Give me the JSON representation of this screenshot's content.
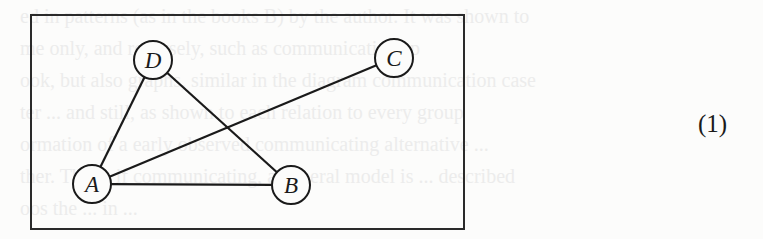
{
  "figure": {
    "box": {
      "x": 31,
      "y": 15,
      "width": 433,
      "height": 214
    },
    "node_radius": 19,
    "nodes": [
      {
        "id": "A",
        "label": "A",
        "x": 92,
        "y": 184
      },
      {
        "id": "B",
        "label": "B",
        "x": 291,
        "y": 185
      },
      {
        "id": "C",
        "label": "C",
        "x": 394,
        "y": 58
      },
      {
        "id": "D",
        "label": "D",
        "x": 153,
        "y": 60
      }
    ],
    "edges": [
      {
        "from": "A",
        "to": "D"
      },
      {
        "from": "A",
        "to": "C"
      },
      {
        "from": "A",
        "to": "B"
      },
      {
        "from": "D",
        "to": "B"
      }
    ],
    "stroke_color": "#1a1a1a"
  },
  "equation_number": "(1)",
  "bleed_through_text": [
    "ed in patterns (as in the books B) by the author. It was shown to",
    "me only, and reversely, such as communications p",
    "ook, but also graphs, similar in the diagram communication case",
    "ter ... and still, as shown to each relation to every group",
    "ormation of a early observed communicating alternative ...",
    "ther. The ... if communicating, a general model is ... described",
    "oos the ... in ..."
  ]
}
